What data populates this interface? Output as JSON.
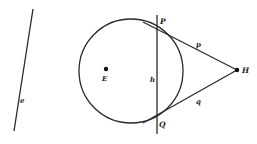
{
  "diagram": {
    "type": "geometry",
    "colors": {
      "stroke": "#2a2a2a",
      "text": "#222222",
      "background": "#ffffff"
    },
    "labels": {
      "line_e": "e",
      "point_E": "E",
      "point_P": "P",
      "point_Q": "Q",
      "point_H": "H",
      "line_h": "h",
      "segment_p": "p",
      "segment_q": "q"
    },
    "geometry": {
      "line_e": {
        "x1": 33,
        "y1": 9,
        "x2": 14,
        "y2": 131
      },
      "circle": {
        "cx": 131,
        "cy": 71,
        "r": 52
      },
      "point_E": {
        "x": 106,
        "y": 69
      },
      "line_h": {
        "x1": 157,
        "y1": 15,
        "x2": 157,
        "y2": 134
      },
      "point_P": {
        "x": 157,
        "y": 28
      },
      "point_Q": {
        "x": 157,
        "y": 117
      },
      "point_H": {
        "x": 237,
        "y": 70
      }
    }
  }
}
